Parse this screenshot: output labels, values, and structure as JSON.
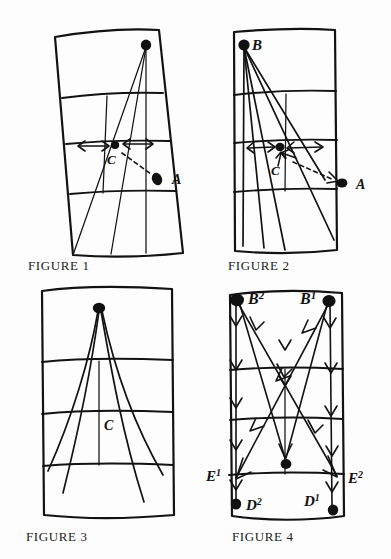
{
  "page": {
    "background_color": "#fdfdfd",
    "ink_color": "#121212",
    "width": 391,
    "height": 559
  },
  "figures": [
    {
      "id": "figure-1",
      "caption": "FIGURE 1",
      "panel_shape": "hand-drawn quadrilateral grid, narrower at bottom-left, 4 horizontal bands",
      "focus_point": {
        "label": "",
        "position": "top-right",
        "marker": "filled-dot"
      },
      "labels": [
        {
          "name": "C",
          "text": "C",
          "role": "center-point-label"
        },
        {
          "name": "A",
          "text": "A",
          "role": "target-point-label"
        }
      ],
      "markers": [
        {
          "name": "focus-dot",
          "kind": "filled-dot"
        },
        {
          "name": "c-dot",
          "kind": "filled-dot"
        },
        {
          "name": "a-dot",
          "kind": "filled-dot"
        }
      ],
      "annotations": [
        {
          "name": "double-arrow-left",
          "kind": "double-headed-arrow"
        },
        {
          "name": "double-arrow-right",
          "kind": "double-headed-arrow"
        },
        {
          "name": "c-to-a-dashed",
          "kind": "dashed-line"
        }
      ],
      "ray_count": 3
    },
    {
      "id": "figure-2",
      "caption": "FIGURE 2",
      "panel_shape": "hand-drawn rectangle grid, 4 horizontal bands",
      "focus_point": {
        "label": "B",
        "position": "top-left",
        "marker": "filled-dot"
      },
      "labels": [
        {
          "name": "B",
          "text": "B",
          "role": "focus-point-label"
        },
        {
          "name": "C",
          "text": "C",
          "role": "center-point-label"
        },
        {
          "name": "A",
          "text": "A",
          "role": "target-point-label"
        }
      ],
      "markers": [
        {
          "name": "b-dot",
          "kind": "filled-dot"
        },
        {
          "name": "c-dot",
          "kind": "filled-dot"
        },
        {
          "name": "a-dot",
          "kind": "filled-dot"
        }
      ],
      "annotations": [
        {
          "name": "double-arrow-left",
          "kind": "double-headed-arrow"
        },
        {
          "name": "double-arrow-right",
          "kind": "double-headed-arrow"
        },
        {
          "name": "c-up-arrow",
          "kind": "single-arrow"
        },
        {
          "name": "c-to-a-dashed",
          "kind": "dashed-line"
        }
      ],
      "ray_count": 5
    },
    {
      "id": "figure-3",
      "caption": "FIGURE 3",
      "panel_shape": "hand-drawn rectangle grid, 4 horizontal bands",
      "focus_point": {
        "label": "",
        "position": "top-center",
        "marker": "filled-dot"
      },
      "labels": [
        {
          "name": "C",
          "text": "C",
          "role": "center-line-label"
        }
      ],
      "markers": [
        {
          "name": "apex-dot",
          "kind": "filled-dot"
        }
      ],
      "annotations": [],
      "ray_count": 4
    },
    {
      "id": "figure-4",
      "caption": "FIGURE 4",
      "panel_shape": "hand-drawn rectangle grid, 4 horizontal bands, dense arrow flow field",
      "labels": [
        {
          "name": "B2",
          "text": "B",
          "sup": "2",
          "role": "top-left-point-label"
        },
        {
          "name": "B1",
          "text": "B",
          "sup": "1",
          "role": "top-right-point-label"
        },
        {
          "name": "E1",
          "text": "E",
          "sup": "1",
          "role": "left-epipole-label"
        },
        {
          "name": "E2",
          "text": "E",
          "sup": "2",
          "role": "right-epipole-label"
        },
        {
          "name": "D2",
          "text": "D",
          "sup": "2",
          "role": "bottom-left-point-label"
        },
        {
          "name": "D1",
          "text": "D",
          "sup": "1",
          "role": "bottom-right-point-label"
        }
      ],
      "markers": [
        {
          "name": "b2-dot",
          "kind": "filled-dot"
        },
        {
          "name": "b1-dot",
          "kind": "filled-dot"
        },
        {
          "name": "center-dot",
          "kind": "filled-dot"
        },
        {
          "name": "d2-dot",
          "kind": "filled-dot"
        },
        {
          "name": "d1-dot",
          "kind": "filled-dot"
        }
      ],
      "annotations": [
        {
          "name": "vertical-flow-left",
          "kind": "arrow-chain-down"
        },
        {
          "name": "vertical-flow-center",
          "kind": "arrow-chain-down"
        },
        {
          "name": "vertical-flow-right",
          "kind": "arrow-chain-down"
        },
        {
          "name": "diagonal-b2-to-e2",
          "kind": "arrow-line"
        },
        {
          "name": "diagonal-b1-to-e1",
          "kind": "arrow-line"
        },
        {
          "name": "v-converge-center",
          "kind": "arrow-line-pair"
        }
      ]
    }
  ]
}
